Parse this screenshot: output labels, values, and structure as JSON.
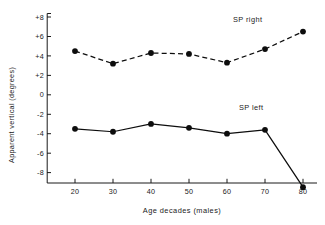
{
  "chart_data": {
    "type": "line",
    "title": "",
    "xlabel": "Age decades (males)",
    "ylabel": "Apparent vertical (degrees)",
    "x": [
      20,
      30,
      40,
      50,
      60,
      70,
      80
    ],
    "categories": [
      "20",
      "30",
      "40",
      "50",
      "60",
      "70",
      "80"
    ],
    "xtick_labels": [
      "20",
      "30",
      "40",
      "50",
      "60",
      "70",
      "80"
    ],
    "ytick_labels": [
      "+8",
      "+6",
      "+4",
      "+2",
      "0",
      "-2",
      "-4",
      "-6",
      "-8"
    ],
    "ytick_values": [
      8,
      6,
      4,
      2,
      0,
      -2,
      -4,
      -6,
      -8
    ],
    "xlim": [
      14,
      84
    ],
    "ylim": [
      -10,
      8.6
    ],
    "grid": false,
    "legend_position": "inline-annotation",
    "series": [
      {
        "name": "SP right",
        "style": "dashed",
        "marker": "filled-circle",
        "label_text": "SP right",
        "values": [
          4.5,
          3.2,
          4.3,
          4.2,
          3.3,
          4.7,
          6.5
        ]
      },
      {
        "name": "SP left",
        "style": "solid",
        "marker": "filled-circle",
        "label_text": "SP left",
        "values": [
          -3.5,
          -3.8,
          -3.0,
          -3.4,
          -4.0,
          -3.6,
          -9.5
        ]
      }
    ],
    "annotations": [
      {
        "text": "SP right",
        "x": 68,
        "y": 18
      },
      {
        "text": "SP left",
        "x": 68,
        "y": 105
      }
    ]
  },
  "colors": {
    "ink": "#0d0d0d",
    "background": "#ffffff"
  }
}
